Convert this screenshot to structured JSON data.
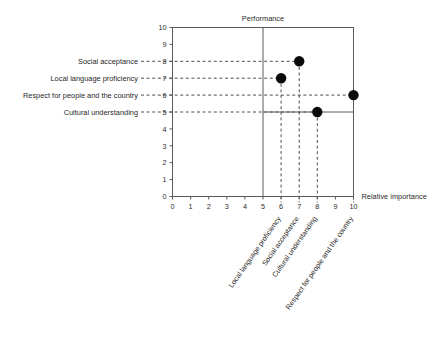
{
  "chart_data": {
    "type": "scatter",
    "title": "",
    "xlabel": "Relative importance",
    "ylabel": "Performance",
    "xlim": [
      0,
      10
    ],
    "ylim": [
      0,
      10
    ],
    "xticks": [
      "0",
      "1",
      "2",
      "3",
      "4",
      "5",
      "6",
      "7",
      "8",
      "9",
      "10"
    ],
    "yticks": [
      "0",
      "1",
      "2",
      "3",
      "4",
      "5",
      "6",
      "7",
      "8",
      "9",
      "10"
    ],
    "grid": false,
    "legend": "none",
    "quadrant_dividers": {
      "x": 5,
      "y": 5
    },
    "points": [
      {
        "label": "Social acceptance",
        "x": 7,
        "y": 8
      },
      {
        "label": "Local language proficiency",
        "x": 6,
        "y": 7
      },
      {
        "label": "Respect for people and the country",
        "x": 10,
        "y": 6
      },
      {
        "label": "Cultural understanding",
        "x": 8,
        "y": 5
      }
    ],
    "left_labels": [
      {
        "text": "Social acceptance",
        "y": 8
      },
      {
        "text": "Local language proficiency",
        "y": 7
      },
      {
        "text": "Respect for people and the country",
        "y": 6
      },
      {
        "text": "Cultural understanding",
        "y": 5
      }
    ],
    "bottom_rotated_labels": [
      {
        "text": "Local language proficiency",
        "x": 6
      },
      {
        "text": "Social acceptance",
        "x": 7
      },
      {
        "text": "Cultural understanding",
        "x": 8
      },
      {
        "text": "Respect for people and the country",
        "x": 10
      }
    ],
    "colors": {
      "marker": "#0a0a0a",
      "axis": "#5a5a5a",
      "guide": "#3a3a3a",
      "background": "#ffffff"
    }
  }
}
